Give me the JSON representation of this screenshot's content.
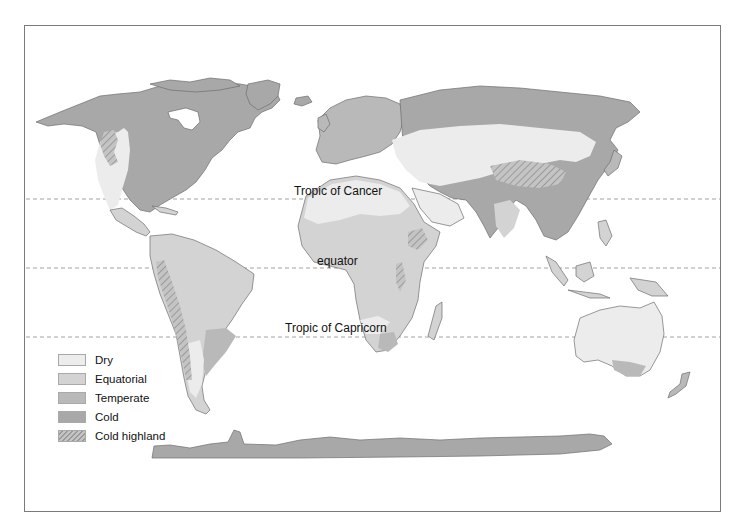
{
  "colors": {
    "dry": "#ececec",
    "equatorial": "#d3d3d3",
    "temperate": "#b9b9b9",
    "cold": "#a8a8a8",
    "cold_highland_base": "#c4c4c4",
    "cold_highland_hatch": "#9a9a9a",
    "coast": "#6e6e6e",
    "frame": "#7a7a7a",
    "dashed_line": "#8a8a8a"
  },
  "lines": {
    "tropic_of_cancer": "Tropic of Cancer",
    "equator": "equator",
    "tropic_of_capricorn": "Tropic of Capricorn"
  },
  "legend": {
    "items": [
      {
        "label": "Dry",
        "key": "dry"
      },
      {
        "label": "Equatorial",
        "key": "equatorial"
      },
      {
        "label": "Temperate",
        "key": "temperate"
      },
      {
        "label": "Cold",
        "key": "cold"
      },
      {
        "label": "Cold highland",
        "key": "cold_highland"
      }
    ]
  }
}
